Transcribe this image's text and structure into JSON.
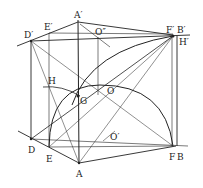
{
  "diagram": {
    "type": "geometric-construction",
    "labels": {
      "A_prime": "A′",
      "E_prime": "E′",
      "D_prime": "D′",
      "O_dprime": "O″",
      "F_prime": "F′",
      "B_prime": "B′",
      "H_prime": "H′",
      "H": "H",
      "G": "G",
      "O": "O",
      "O_prime": "O′",
      "D": "D",
      "E": "E",
      "A": "A",
      "F": "F",
      "B": "B"
    },
    "points": {
      "A_prime": [
        78,
        22
      ],
      "E_prime": [
        49,
        33
      ],
      "D_prime": [
        31,
        41
      ],
      "B_prime": [
        173,
        36
      ],
      "H_prime": [
        177,
        36
      ],
      "A": [
        79,
        163
      ],
      "D": [
        31,
        139
      ],
      "E": [
        49,
        147
      ],
      "F": [
        173,
        146
      ],
      "B": [
        177,
        146
      ],
      "G": [
        78,
        96
      ],
      "H": [
        49,
        88
      ],
      "O": [
        100,
        90
      ],
      "O_prime": [
        110,
        137
      ],
      "O_dprime": [
        97,
        32
      ]
    }
  }
}
